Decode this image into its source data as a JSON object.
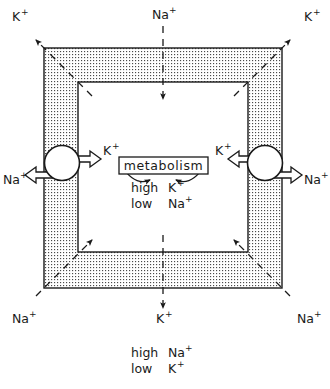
{
  "diagram": {
    "colors": {
      "stroke": "#1a1a1a",
      "membrane_fill": "#d9d9d9",
      "cytoplasm_fill": "#ffffff",
      "page_background": "#ffffff"
    },
    "center_box": {
      "label": "metabolism"
    },
    "inside_conditions": [
      {
        "level": "high",
        "ion": "K",
        "charge": "+"
      },
      {
        "level": "low",
        "ion": "Na",
        "charge": "+"
      }
    ],
    "outside_conditions": [
      {
        "level": "high",
        "ion": "Na",
        "charge": "+"
      },
      {
        "level": "low",
        "ion": "K",
        "charge": "+"
      }
    ],
    "ion_labels": [
      {
        "id": "top-left-k",
        "ion": "K",
        "charge": "+",
        "position": "top-left"
      },
      {
        "id": "top-center-na",
        "ion": "Na",
        "charge": "+",
        "position": "top-center"
      },
      {
        "id": "top-right-k",
        "ion": "K",
        "charge": "+",
        "position": "top-right"
      },
      {
        "id": "left-pump-k",
        "ion": "K",
        "charge": "+",
        "position": "inner-left"
      },
      {
        "id": "left-outer-na",
        "ion": "Na",
        "charge": "+",
        "position": "outer-left"
      },
      {
        "id": "right-pump-k",
        "ion": "K",
        "charge": "+",
        "position": "inner-right"
      },
      {
        "id": "right-outer-na",
        "ion": "Na",
        "charge": "+",
        "position": "outer-right"
      },
      {
        "id": "bottom-left-na",
        "ion": "Na",
        "charge": "+",
        "position": "bottom-left"
      },
      {
        "id": "bottom-center-k",
        "ion": "K",
        "charge": "+",
        "position": "bottom-center"
      },
      {
        "id": "bottom-right-na",
        "ion": "Na",
        "charge": "+",
        "position": "bottom-right"
      }
    ]
  }
}
